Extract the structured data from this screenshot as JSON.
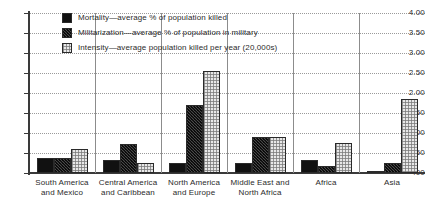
{
  "chart_data": {
    "type": "bar",
    "title": "",
    "subtitle": "",
    "xlabel": "",
    "ylabel": "",
    "ylim": [
      0,
      4.0
    ],
    "ytick_labels": [
      "4.00",
      "3.50",
      "3.00",
      "2.50",
      "2.00",
      "1.50",
      "1.00",
      ".50",
      ".00"
    ],
    "ytick_values": [
      4.0,
      3.5,
      3.0,
      2.5,
      2.0,
      1.5,
      1.0,
      0.5,
      0.0
    ],
    "grid": true,
    "legend_position": "top-left-inside",
    "categories": [
      "South America and Mexico",
      "Central America and Caribbean",
      "North America and Europe",
      "Middle East and North Africa",
      "Africa",
      "Asia"
    ],
    "category_lines": [
      [
        "South America",
        "and Mexico"
      ],
      [
        "Central America",
        "and Caribbean"
      ],
      [
        "North America",
        "and Europe"
      ],
      [
        "Middle East and",
        "North Africa"
      ],
      [
        "Africa",
        ""
      ],
      [
        "Asia",
        ""
      ]
    ],
    "series": [
      {
        "name": "Mortality—average % of population killed",
        "key": "mortality",
        "values": [
          0.38,
          0.33,
          0.25,
          0.25,
          0.33,
          0.05
        ]
      },
      {
        "name": "Militarization—average % of population in military",
        "key": "militarization",
        "values": [
          0.38,
          0.72,
          1.7,
          0.9,
          0.17,
          0.25
        ]
      },
      {
        "name": "Intensity—average population killed per year (20,000s)",
        "key": "intensity",
        "values": [
          0.6,
          0.25,
          2.55,
          0.9,
          0.75,
          1.85
        ]
      }
    ]
  },
  "legend": {
    "items": [
      {
        "label": "Mortality—average % of population killed",
        "swatch": "solid-black-swatch"
      },
      {
        "label": "Militarization—average % of population in military",
        "swatch": "dark-speckled-swatch"
      },
      {
        "label": "Intensity—average population killed per year (20,000s)",
        "swatch": "light-checker-swatch"
      }
    ]
  }
}
